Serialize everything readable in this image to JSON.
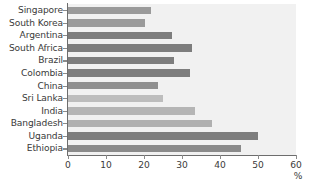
{
  "chart_data": {
    "type": "bar",
    "orientation": "horizontal",
    "title": "",
    "xlabel": "%",
    "ylabel": "",
    "xlim": [
      0,
      60
    ],
    "xticks": [
      0,
      10,
      20,
      30,
      40,
      50,
      60
    ],
    "grid": false,
    "legend": null,
    "categories": [
      "Singapore",
      "South Korea",
      "Argentina",
      "South Africa",
      "Brazil",
      "Colombia",
      "China",
      "Sri Lanka",
      "India",
      "Bangladesh",
      "Uganda",
      "Ethiopia"
    ],
    "values": [
      21.8,
      20.3,
      27.4,
      32.6,
      27.9,
      32.1,
      23.7,
      25.0,
      33.4,
      38.0,
      50.0,
      45.5
    ],
    "bar_colors": [
      "#9a9a9a",
      "#9a9a9a",
      "#7d7d7d",
      "#7d7d7d",
      "#7d7d7d",
      "#7d7d7d",
      "#8f8f8f",
      "#bdbdbd",
      "#b5b5b5",
      "#b0b0b0",
      "#7d7d7d",
      "#8a8a8a"
    ],
    "bars": [
      {
        "category": "Singapore",
        "value": 21.8,
        "color": "#9a9a9a"
      },
      {
        "category": "South Korea",
        "value": 20.3,
        "color": "#9a9a9a"
      },
      {
        "category": "Argentina",
        "value": 27.4,
        "color": "#7d7d7d"
      },
      {
        "category": "South Africa",
        "value": 32.6,
        "color": "#7d7d7d"
      },
      {
        "category": "Brazil",
        "value": 27.9,
        "color": "#7d7d7d"
      },
      {
        "category": "Colombia",
        "value": 32.1,
        "color": "#7d7d7d"
      },
      {
        "category": "China",
        "value": 23.7,
        "color": "#8f8f8f"
      },
      {
        "category": "Sri Lanka",
        "value": 25.0,
        "color": "#bdbdbd"
      },
      {
        "category": "India",
        "value": 33.4,
        "color": "#b5b5b5"
      },
      {
        "category": "Bangladesh",
        "value": 38.0,
        "color": "#b0b0b0"
      },
      {
        "category": "Uganda",
        "value": 50.0,
        "color": "#7d7d7d"
      },
      {
        "category": "Ethiopia",
        "value": 45.5,
        "color": "#8a8a8a"
      }
    ],
    "axis_unit_label": "%",
    "plot_background": "#f1f1f1",
    "axis_color": "#6d6d6d"
  }
}
